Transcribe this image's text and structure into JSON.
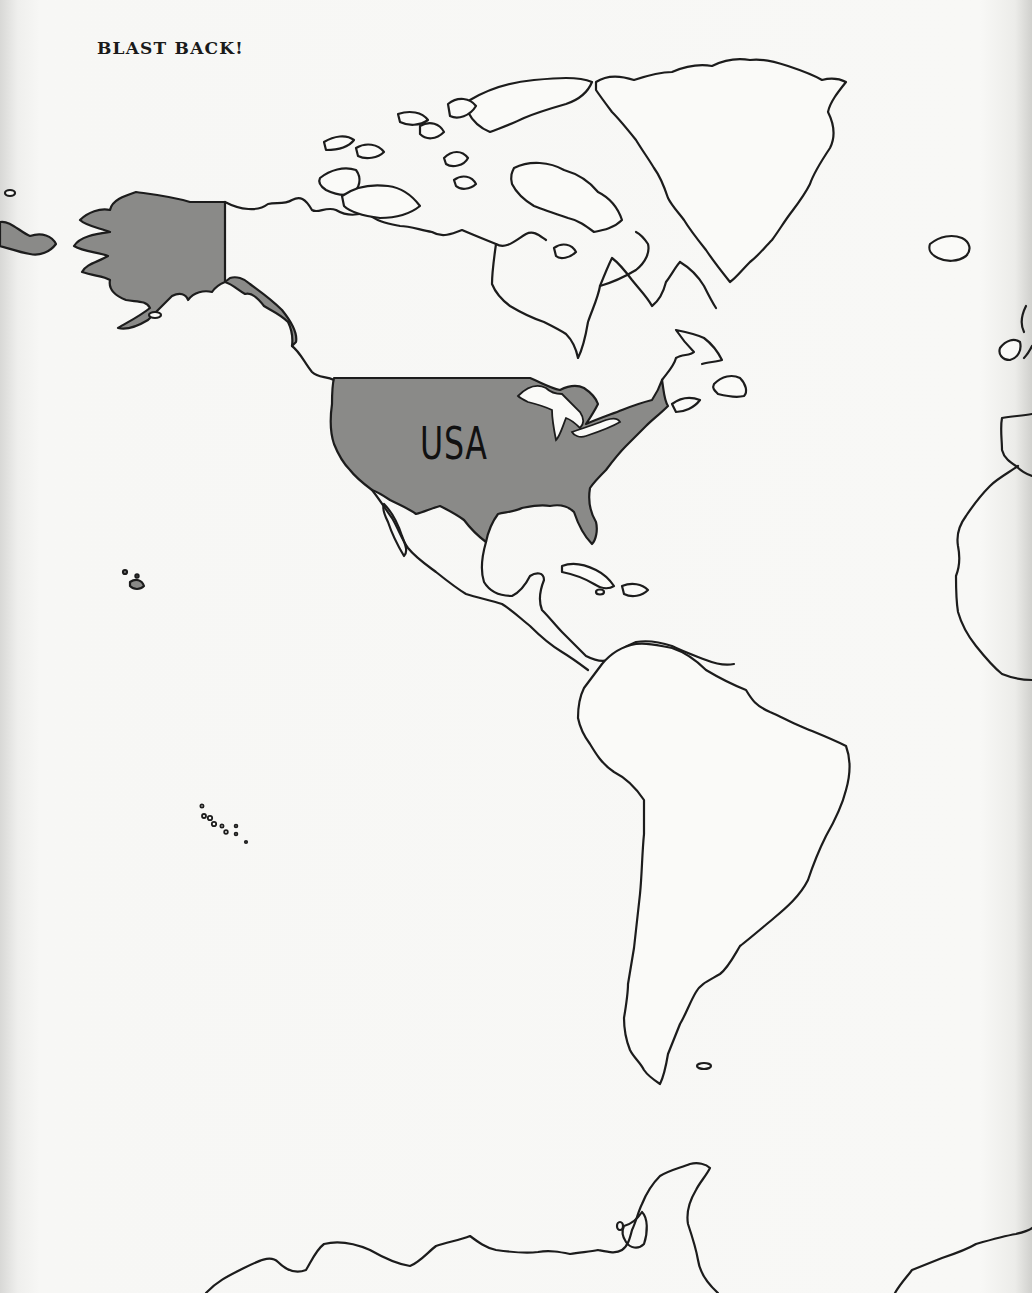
{
  "header": {
    "title": "BLAST BACK!"
  },
  "map": {
    "region": "Americas (North, Central, South America, Greenland, part of Antarctica)",
    "highlighted_country": {
      "name": "USA",
      "label": "USA",
      "fill_color": "#8a8a88",
      "includes": [
        "Contiguous United States",
        "Alaska"
      ]
    },
    "outline_color": "#1c1c1c",
    "land_color": "#fafaf8",
    "background_color": "#f6f6f4"
  }
}
